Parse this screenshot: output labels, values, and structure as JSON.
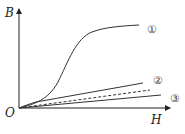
{
  "diagram": {
    "type": "magnetization-curves",
    "axes": {
      "y_label": "B",
      "x_label": "H",
      "origin_label": "O"
    },
    "curves": [
      {
        "id": "curve-1",
        "label": "①",
        "style": "solid",
        "shape": "s-curve-saturating"
      },
      {
        "id": "curve-2",
        "label": "②",
        "style": "solid",
        "shape": "straight-line-steeper"
      },
      {
        "id": "curve-reference",
        "label": "",
        "style": "dashed",
        "shape": "straight-line-reference"
      },
      {
        "id": "curve-3",
        "label": "③",
        "style": "solid",
        "shape": "straight-line-shallower"
      }
    ],
    "colors": {
      "axis": "#222222",
      "curve": "#333333",
      "label": "#444444"
    }
  }
}
